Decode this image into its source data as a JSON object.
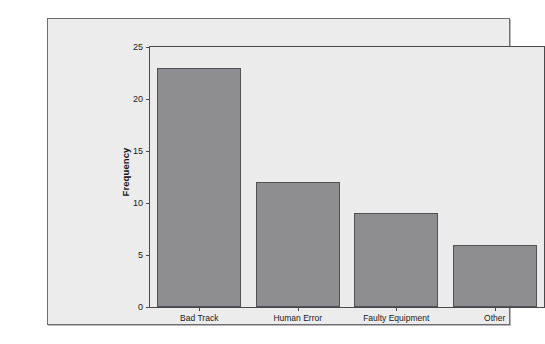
{
  "chart_data": {
    "type": "bar",
    "title": "",
    "subtitle": "",
    "xlabel": "",
    "ylabel": "Frequency",
    "categories": [
      "Bad Track",
      "Human Error",
      "Faulty Equipment",
      "Other"
    ],
    "values": [
      23,
      12,
      9,
      6
    ],
    "ylim": [
      0,
      25
    ],
    "yticks": [
      0,
      5,
      10,
      15,
      20,
      25
    ],
    "ytick_labels": [
      "0",
      "5",
      "10",
      "15",
      "20",
      "25"
    ],
    "grid": false,
    "legend": false,
    "legend_position": "none",
    "colors": {
      "bar_fill": "#8e8e90",
      "bar_edge": "#515153",
      "plot_background": "#ebebec",
      "figure_background": "#ececed",
      "axis": "#4a4a4c",
      "text": "#1a1a1a"
    }
  }
}
